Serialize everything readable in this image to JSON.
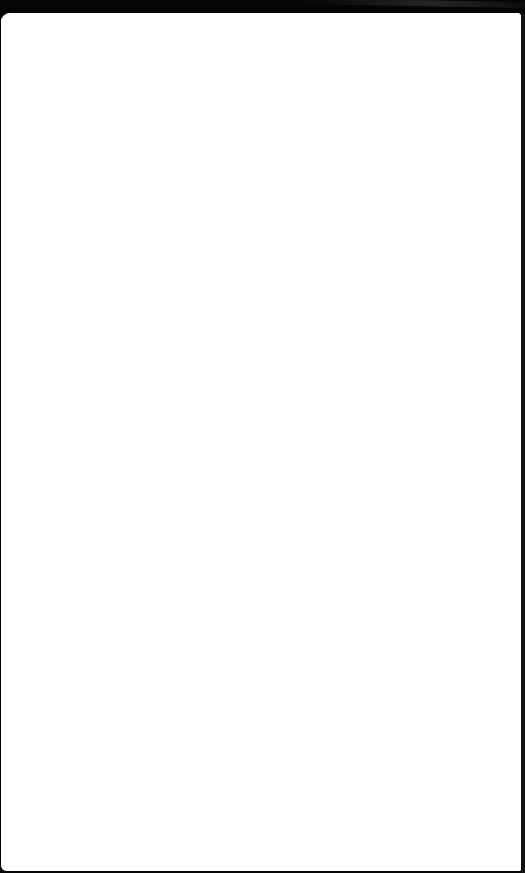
{
  "screen": {
    "description": "blank white window/page inside dark device bezel",
    "background_color": "#ffffff",
    "bezel_color": "#050505"
  },
  "window": {
    "content": []
  }
}
